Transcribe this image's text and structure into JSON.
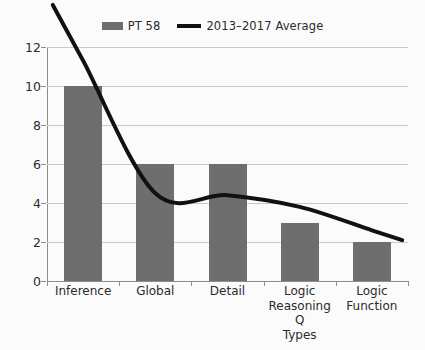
{
  "chart_data": {
    "type": "bar",
    "title": "",
    "xlabel": "",
    "ylabel": "",
    "categories": [
      "Inference",
      "Global",
      "Detail",
      "Logic Reasoning Q Types",
      "Logic Function"
    ],
    "ylim": [
      0,
      12
    ],
    "yticks": [
      0,
      2,
      4,
      6,
      8,
      10,
      12
    ],
    "grid": true,
    "legend_position": "top-center",
    "series": [
      {
        "name": "PT 58",
        "type": "bar",
        "color": "#6e6e6e",
        "values": [
          10,
          6,
          6,
          3,
          2
        ]
      },
      {
        "name": "2013–2017 Average",
        "type": "line",
        "color": "#111111",
        "values": [
          11.3,
          4.5,
          4.4,
          3.8,
          2.6
        ]
      }
    ]
  },
  "legend": {
    "entries": [
      {
        "label": "PT 58",
        "swatch": "bar-swatch",
        "color": "#6e6e6e"
      },
      {
        "label": "2013–2017 Average",
        "swatch": "line-swatch",
        "color": "#111111"
      }
    ]
  },
  "axes": {
    "y_tick_labels": [
      "12",
      "10",
      "8",
      "6",
      "4",
      "2",
      "0"
    ],
    "x_tick_labels": [
      [
        "Inference"
      ],
      [
        "Global"
      ],
      [
        "Detail"
      ],
      [
        "Logic",
        "Reasoning Q",
        "Types"
      ],
      [
        "Logic",
        "Function"
      ]
    ]
  },
  "colors": {
    "background": "#fbfbfb",
    "bar_fill": "#6e6e6e",
    "line_stroke": "#111111",
    "grid": "#c9c9c9",
    "axis": "#8d8d8d",
    "text": "#2b2b2b"
  }
}
